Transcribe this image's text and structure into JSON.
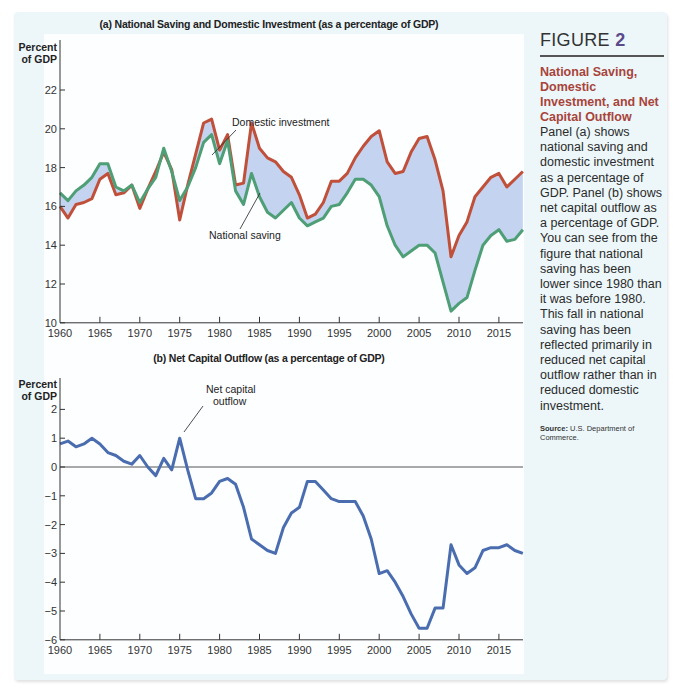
{
  "figure": {
    "label": "FIGURE",
    "number": "2",
    "title": "National Saving, Domestic Investment, and Net Capital Outflow",
    "body": "Panel (a) shows national saving and domestic investment as a percentage of GDP. Panel (b) shows net capital outflow as a percentage of GDP. You can see from the figure that national saving has been lower since 1980 than it was before 1980. This fall in national saving has been reflected primarily in reduced net capital outflow rather than in reduced domestic investment.",
    "source_label": "Source:",
    "source_text": "U.S. Department of Commerce."
  },
  "colors": {
    "domestic_investment": "#c0503a",
    "national_saving": "#4e9e76",
    "fill_between": "#c3d3f0",
    "net_capital_outflow": "#4a6db0",
    "caption_title": "#a8443a",
    "figure_number": "#5a4a8a",
    "background": "#edf7fa"
  },
  "chart_data": [
    {
      "type": "line",
      "title": "(a) National Saving and Domestic Investment (as a percentage of GDP)",
      "xlabel": "",
      "ylabel": "Percent of GDP",
      "xlim": [
        1960,
        2018
      ],
      "ylim": [
        10,
        22
      ],
      "yticks": [
        10,
        12,
        14,
        16,
        18,
        20,
        22
      ],
      "xticks": [
        1960,
        1965,
        1970,
        1975,
        1980,
        1985,
        1990,
        1995,
        2000,
        2005,
        2010,
        2015
      ],
      "grid": false,
      "annotations": [
        "Domestic investment",
        "National saving"
      ],
      "x": [
        1960,
        1961,
        1962,
        1963,
        1964,
        1965,
        1966,
        1967,
        1968,
        1969,
        1970,
        1971,
        1972,
        1973,
        1974,
        1975,
        1976,
        1977,
        1978,
        1979,
        1980,
        1981,
        1982,
        1983,
        1984,
        1985,
        1986,
        1987,
        1988,
        1989,
        1990,
        1991,
        1992,
        1993,
        1994,
        1995,
        1996,
        1997,
        1998,
        1999,
        2000,
        2001,
        2002,
        2003,
        2004,
        2005,
        2006,
        2007,
        2008,
        2009,
        2010,
        2011,
        2012,
        2013,
        2014,
        2015,
        2016,
        2017,
        2018
      ],
      "series": [
        {
          "name": "Domestic investment",
          "values": [
            16.0,
            15.4,
            16.1,
            16.2,
            16.4,
            17.4,
            17.7,
            16.6,
            16.7,
            17.1,
            15.9,
            16.9,
            17.8,
            18.8,
            17.9,
            15.3,
            17.1,
            18.7,
            20.3,
            20.5,
            18.9,
            19.7,
            17.1,
            17.2,
            20.3,
            19.0,
            18.5,
            18.3,
            17.8,
            17.5,
            16.6,
            15.4,
            15.6,
            16.2,
            17.3,
            17.3,
            17.7,
            18.5,
            19.1,
            19.6,
            19.9,
            18.3,
            17.7,
            17.8,
            18.8,
            19.5,
            19.6,
            18.4,
            16.8,
            13.4,
            14.5,
            15.2,
            16.5,
            17.0,
            17.5,
            17.7,
            17.0,
            17.4,
            17.8
          ]
        },
        {
          "name": "National saving",
          "values": [
            16.7,
            16.3,
            16.8,
            17.1,
            17.5,
            18.2,
            18.2,
            17.0,
            16.8,
            17.1,
            16.2,
            16.9,
            17.5,
            19.0,
            17.8,
            16.3,
            17.0,
            18.0,
            19.3,
            19.7,
            18.2,
            19.4,
            16.8,
            16.1,
            17.7,
            16.5,
            15.7,
            15.4,
            15.8,
            16.2,
            15.4,
            15.0,
            15.2,
            15.4,
            16.0,
            16.1,
            16.7,
            17.4,
            17.4,
            17.1,
            16.5,
            15.0,
            14.0,
            13.4,
            13.7,
            14.0,
            14.0,
            13.6,
            12.1,
            10.6,
            11.0,
            11.3,
            12.7,
            14.0,
            14.5,
            14.8,
            14.2,
            14.3,
            14.8
          ]
        }
      ]
    },
    {
      "type": "line",
      "title": "(b) Net Capital Outflow (as a percentage of GDP)",
      "xlabel": "",
      "ylabel": "Percent of GDP",
      "xlim": [
        1960,
        2018
      ],
      "ylim": [
        -6,
        2
      ],
      "yticks": [
        -6,
        -5,
        -4,
        -3,
        -2,
        -1,
        0,
        1,
        2
      ],
      "xticks": [
        1960,
        1965,
        1970,
        1975,
        1980,
        1985,
        1990,
        1995,
        2000,
        2005,
        2010,
        2015
      ],
      "grid": false,
      "annotations": [
        "Net capital outflow"
      ],
      "x": [
        1960,
        1961,
        1962,
        1963,
        1964,
        1965,
        1966,
        1967,
        1968,
        1969,
        1970,
        1971,
        1972,
        1973,
        1974,
        1975,
        1976,
        1977,
        1978,
        1979,
        1980,
        1981,
        1982,
        1983,
        1984,
        1985,
        1986,
        1987,
        1988,
        1989,
        1990,
        1991,
        1992,
        1993,
        1994,
        1995,
        1996,
        1997,
        1998,
        1999,
        2000,
        2001,
        2002,
        2003,
        2004,
        2005,
        2006,
        2007,
        2008,
        2009,
        2010,
        2011,
        2012,
        2013,
        2014,
        2015,
        2016,
        2017,
        2018
      ],
      "series": [
        {
          "name": "Net capital outflow",
          "values": [
            0.8,
            0.9,
            0.7,
            0.8,
            1.0,
            0.8,
            0.5,
            0.4,
            0.2,
            0.1,
            0.4,
            0.0,
            -0.3,
            0.3,
            -0.1,
            1.0,
            -0.1,
            -1.1,
            -1.1,
            -0.9,
            -0.5,
            -0.4,
            -0.6,
            -1.4,
            -2.5,
            -2.7,
            -2.9,
            -3.0,
            -2.1,
            -1.6,
            -1.4,
            -0.5,
            -0.5,
            -0.8,
            -1.1,
            -1.2,
            -1.2,
            -1.2,
            -1.7,
            -2.5,
            -3.7,
            -3.6,
            -4.0,
            -4.5,
            -5.1,
            -5.6,
            -5.6,
            -4.9,
            -4.9,
            -2.7,
            -3.4,
            -3.7,
            -3.5,
            -2.9,
            -2.8,
            -2.8,
            -2.7,
            -2.9,
            -3.0
          ]
        }
      ]
    }
  ]
}
